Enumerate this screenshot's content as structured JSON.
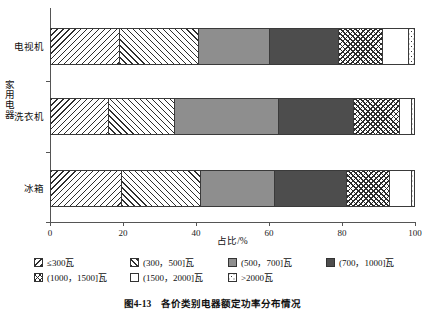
{
  "chart_data": {
    "type": "bar",
    "orientation": "horizontal",
    "stacked": true,
    "normalized_percent": true,
    "title": "",
    "xlabel": "占比/%",
    "ylabel": "家用电器",
    "xlim": [
      0,
      100
    ],
    "xticks": [
      0,
      20,
      40,
      60,
      80,
      100
    ],
    "xtick_labels": [
      "0",
      "20",
      "40",
      "60",
      "80",
      "100"
    ],
    "grid": false,
    "legend_position": "bottom",
    "categories": [
      "电视机",
      "洗衣机",
      "冰箱"
    ],
    "series": [
      {
        "name": "≤300瓦",
        "pattern": "diagonal-backslash",
        "values": [
          19.0,
          15.8,
          19.5
        ]
      },
      {
        "name": "(300，500]瓦",
        "pattern": "diagonal-slash",
        "values": [
          21.5,
          18.2,
          21.5
        ]
      },
      {
        "name": "(500，700]瓦",
        "pattern": "solid-gray",
        "values": [
          19.5,
          28.5,
          20.5
        ]
      },
      {
        "name": "(700，1000]瓦",
        "pattern": "solid-dark-gray",
        "values": [
          19.0,
          20.5,
          19.5
        ]
      },
      {
        "name": "(1000，1500]瓦",
        "pattern": "cross-hatch",
        "values": [
          12.0,
          12.5,
          12.0
        ]
      },
      {
        "name": "(1500，2000]瓦",
        "pattern": "white",
        "values": [
          7.0,
          3.3,
          6.0
        ]
      },
      {
        "name": ">2000瓦",
        "pattern": "speckle",
        "values": [
          2.0,
          1.2,
          1.0
        ]
      }
    ]
  },
  "axes": {
    "x_title": "占比/%",
    "y_title": "家用电器",
    "x_ticks": [
      {
        "label": "0",
        "value": 0
      },
      {
        "label": "20",
        "value": 20
      },
      {
        "label": "40",
        "value": 40
      },
      {
        "label": "60",
        "value": 60
      },
      {
        "label": "80",
        "value": 80
      },
      {
        "label": "100",
        "value": 100
      }
    ],
    "y_ticks": [
      {
        "label": "电视机"
      },
      {
        "label": "洗衣机"
      },
      {
        "label": "冰箱"
      }
    ]
  },
  "legend": {
    "row1": [
      {
        "label": "≤300瓦",
        "swatch": "diagonal-backslash-swatch"
      },
      {
        "label": "(300，500]瓦",
        "swatch": "diagonal-slash-swatch"
      },
      {
        "label": "(500，700]瓦",
        "swatch": "solid-gray-swatch"
      },
      {
        "label": "(700，1000]瓦",
        "swatch": "solid-dark-gray-swatch"
      }
    ],
    "row2": [
      {
        "label": "(1000，1500]瓦",
        "swatch": "cross-hatch-swatch"
      },
      {
        "label": "(1500，2000]瓦",
        "swatch": "white-swatch"
      },
      {
        "label": ">2000瓦",
        "swatch": "speckle-swatch"
      }
    ]
  },
  "caption": {
    "text": "图4-13　各价类别电器额定功率分布情况"
  },
  "colors": {
    "axis": "#555555",
    "outline": "#3a3a3a",
    "gray": "#8e8e8e",
    "dark_gray": "#4d4d4d",
    "text": "#111111"
  }
}
